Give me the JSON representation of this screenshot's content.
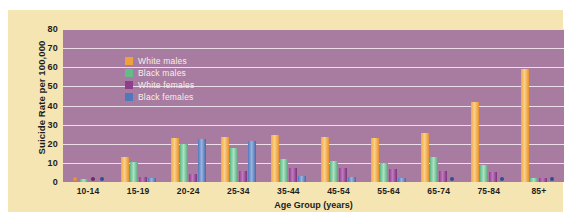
{
  "chart_data": {
    "type": "bar",
    "title": "",
    "xlabel": "Age Group (years)",
    "ylabel": "Suicide Rate per 100,000",
    "ylim": [
      0,
      80
    ],
    "yticks": [
      0,
      10,
      20,
      30,
      40,
      50,
      60,
      70,
      80
    ],
    "grid": true,
    "legend_position": "top-left-inside",
    "categories": [
      "10-14",
      "15-19",
      "20-24",
      "25-34",
      "35-44",
      "45-54",
      "55-64",
      "65-74",
      "75-84",
      "85+"
    ],
    "series": [
      {
        "name": "White males",
        "color": "#f0a23a",
        "values": [
          1.5,
          13.0,
          23.0,
          23.5,
          24.5,
          23.5,
          23.0,
          25.5,
          42.0,
          59.0
        ]
      },
      {
        "name": "Black males",
        "color": "#63bd8b",
        "values": [
          1.8,
          10.5,
          20.0,
          18.0,
          12.0,
          11.0,
          10.0,
          13.0,
          9.0,
          2.0
        ]
      },
      {
        "name": "White females",
        "color": "#8e3f8c",
        "values": [
          0.6,
          2.5,
          4.0,
          6.0,
          7.5,
          7.5,
          7.0,
          6.0,
          5.0,
          2.0
        ]
      },
      {
        "name": "Black females",
        "color": "#4f78bd",
        "values": [
          0.4,
          2.0,
          22.5,
          21.5,
          3.0,
          2.5,
          2.0,
          1.5,
          1.5,
          1.5
        ]
      }
    ],
    "markers_note": "Small dots denote rates at or near zero"
  },
  "legend": {
    "items": [
      {
        "label": "White males",
        "color": "#f0a23a"
      },
      {
        "label": "Black males",
        "color": "#63bd8b"
      },
      {
        "label": "White females",
        "color": "#8e3f8c"
      },
      {
        "label": "Black females",
        "color": "#4f78bd"
      }
    ]
  },
  "colors": {
    "panel_background": "#f4e5b2",
    "plot_background": "#a87ba1",
    "gridline": "#f3e7f0",
    "text": "#1d1d1d",
    "legend_text": "#f6efe8"
  }
}
